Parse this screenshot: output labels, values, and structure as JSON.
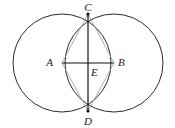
{
  "figure": {
    "background_color": "#ffffff",
    "canvas": {
      "width": 175,
      "height": 128
    },
    "stroke_colors": {
      "circle": "#2b2b2b",
      "axis": "#111111",
      "chord": "#9a9a9a"
    },
    "points": [
      {
        "name": "A",
        "label": "A",
        "x": 62,
        "y": 63,
        "label_x": 53,
        "label_y": 66
      },
      {
        "name": "B",
        "label": "B",
        "x": 114,
        "y": 63,
        "label_x": 118,
        "label_y": 66
      },
      {
        "name": "C",
        "label": "C",
        "x": 88,
        "y": 14,
        "label_x": 84,
        "label_y": 11
      },
      {
        "name": "D",
        "label": "D",
        "x": 88,
        "y": 111,
        "label_x": 84,
        "label_y": 124
      },
      {
        "name": "E",
        "label": "E",
        "x": 88,
        "y": 63,
        "label_x": 90,
        "label_y": 76
      }
    ],
    "circles": [
      {
        "name": "circle-left",
        "cx": 62,
        "cy": 63,
        "r": 49
      },
      {
        "name": "circle-right",
        "cx": 114,
        "cy": 63,
        "r": 49
      }
    ],
    "segments": [
      {
        "name": "segment-AB",
        "from": "A",
        "to": "B",
        "style": "solid-dark"
      },
      {
        "name": "segment-CD",
        "from": "C",
        "to": "D",
        "style": "solid-dark"
      },
      {
        "name": "segment-AC",
        "from": "A",
        "to": "C",
        "style": "thin-gray"
      },
      {
        "name": "segment-CB",
        "from": "C",
        "to": "B",
        "style": "thin-gray"
      },
      {
        "name": "segment-BD",
        "from": "B",
        "to": "D",
        "style": "thin-gray"
      },
      {
        "name": "segment-DA",
        "from": "D",
        "to": "A",
        "style": "thin-gray"
      }
    ]
  }
}
